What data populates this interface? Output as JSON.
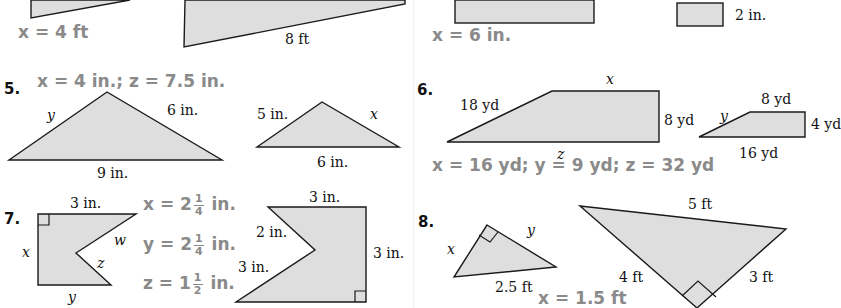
{
  "page": {
    "colors": {
      "answer_text": "#8a8a8a",
      "shape_fill": "#dedede",
      "stroke": "#1a1a1a",
      "label_text": "#111111"
    }
  },
  "top_row": {
    "left": {
      "answer": "x = 4 ft",
      "label_bottom": "8 ft"
    },
    "right": {
      "answer": "x = 6 in.",
      "label_small_rect": "2 in."
    }
  },
  "problems": [
    {
      "number": "5.",
      "answer": "x = 4 in.; z = 7.5 in.",
      "figure_large": {
        "left": "y",
        "right": "6 in.",
        "bottom": "9 in."
      },
      "figure_small": {
        "left": "5 in.",
        "right": "x",
        "bottom": "6 in."
      }
    },
    {
      "number": "6.",
      "answer": "x = 16 yd; y = 9 yd; z = 32 yd",
      "figure_large": {
        "top": "x",
        "slant": "18 yd",
        "right": "8 yd",
        "bottom": "z"
      },
      "figure_small": {
        "top": "8 yd",
        "slant": "y",
        "right": "4 yd",
        "bottom": "16 yd"
      }
    },
    {
      "number": "7.",
      "answers": [
        {
          "var": "x",
          "whole": "2",
          "num": "1",
          "den": "4",
          "unit": "in."
        },
        {
          "var": "y",
          "whole": "2",
          "num": "1",
          "den": "4",
          "unit": "in."
        },
        {
          "var": "z",
          "whole": "1",
          "num": "1",
          "den": "2",
          "unit": "in."
        }
      ],
      "figure_small": {
        "top": "3 in.",
        "left": "x",
        "upper_notch": "w",
        "lower_notch": "z",
        "bottom": "y"
      },
      "figure_large": {
        "top": "3 in.",
        "upper_notch": "2 in.",
        "lower_notch": "3 in.",
        "right": "3 in."
      }
    },
    {
      "number": "8.",
      "answer": "x = 1.5 ft",
      "figure_small": {
        "left": "x",
        "right": "y",
        "bottom": "2.5 ft"
      },
      "figure_large": {
        "top": "5 ft",
        "left": "4 ft",
        "right": "3 ft"
      }
    }
  ]
}
